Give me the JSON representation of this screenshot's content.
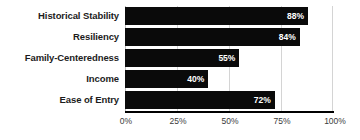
{
  "chart_data": {
    "type": "bar",
    "orientation": "horizontal",
    "title": "",
    "xlabel": "",
    "ylabel": "",
    "categories": [
      "Historical Stability",
      "Resiliency",
      "Family-Centeredness",
      "Income",
      "Ease of Entry"
    ],
    "values": [
      88,
      84,
      55,
      40,
      72
    ],
    "value_labels": [
      "88%",
      "84%",
      "55%",
      "40%",
      "72%"
    ],
    "xlim": [
      0,
      100
    ],
    "xticks": [
      0,
      25,
      50,
      75,
      100
    ],
    "xtick_labels": [
      "0%",
      "25%",
      "50%",
      "75%",
      "100%"
    ],
    "grid": true,
    "legend": false,
    "bar_color": "#0a0a0a",
    "value_label_color": "#ffffff",
    "gridline_color": "#d4d4d4",
    "axis_color": "#000000",
    "category_label_color": "#1c1c1c",
    "tick_label_color": "#3a3a3a",
    "background_color": "#ffffff"
  }
}
